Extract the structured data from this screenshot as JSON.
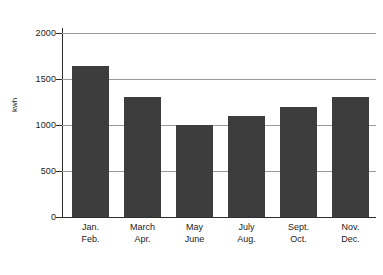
{
  "chart_data": {
    "type": "bar",
    "title": "",
    "subtitle": "",
    "xlabel": "",
    "ylabel": "kwh",
    "categories": [
      "Jan. Feb.",
      "March Apr.",
      "May June",
      "July Aug.",
      "Sept. Oct.",
      "Nov. Dec."
    ],
    "category_lines": [
      [
        "Jan.",
        "Feb."
      ],
      [
        "March",
        "Apr."
      ],
      [
        "May",
        "June"
      ],
      [
        "July",
        "Aug."
      ],
      [
        "Sept.",
        "Oct."
      ],
      [
        "Nov.",
        "Dec."
      ]
    ],
    "values": [
      1640,
      1300,
      1000,
      1100,
      1200,
      1300
    ],
    "ylim": [
      0,
      2000
    ],
    "yticks": [
      0,
      500,
      1000,
      1500,
      2000
    ],
    "ytick_labels": [
      "0",
      "500",
      "1000",
      "1500",
      "2000"
    ],
    "grid": true,
    "grid_axis": "y",
    "legend": false,
    "legend_position": "none",
    "bar_color": "#3d3d3d",
    "gridline_color": "#9a9a9a",
    "axis_color": "#2f2f2f",
    "background_color": "#ffffff",
    "text_color": "#1c1c1c"
  }
}
